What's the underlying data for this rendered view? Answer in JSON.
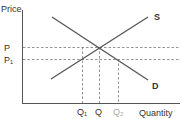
{
  "diagram": {
    "type": "supply-demand",
    "y_axis_label": "Price",
    "x_axis_label": "Quantity",
    "curves": [
      {
        "name": "S",
        "label": "S",
        "from": [
          51,
          79
        ],
        "to": [
          148,
          17
        ]
      },
      {
        "name": "D",
        "label": "D",
        "from": [
          52,
          17
        ],
        "to": [
          148,
          80
        ]
      }
    ],
    "price_levels": [
      {
        "label": "P",
        "y": 47
      },
      {
        "label": "P₁",
        "y": 59
      }
    ],
    "quantity_levels": [
      {
        "label": "Q₁",
        "x": 82
      },
      {
        "label": "Q",
        "x": 99
      },
      {
        "label": "Q₂",
        "x": 118
      }
    ],
    "colors": {
      "axis": "#555555",
      "curve": "#555555",
      "dashed": "#777777",
      "text": "#333333",
      "q2_text": "#aaaaaa"
    }
  }
}
